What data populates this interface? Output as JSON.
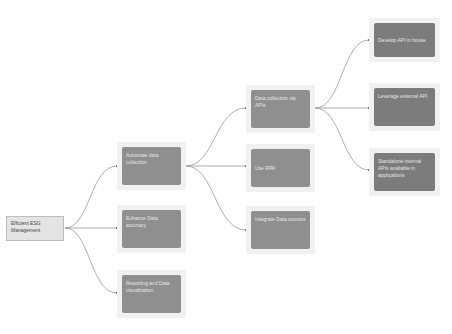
{
  "diagram": {
    "type": "mind-map",
    "colors": {
      "background": "#ffffff",
      "root_fill": "#e4e4e4",
      "root_border": "#bdbdbd",
      "node_frame": "#f1f1f1",
      "node_fill": "#8f8f8f",
      "leaf_fill": "#7c7c7c",
      "node_text": "#e6e6e6",
      "edge": "#9a9a9a"
    },
    "root": {
      "label": "Efficient ESG Management"
    },
    "level1": [
      {
        "label": "Automate data collection"
      },
      {
        "label": "Enhance Data accuracy"
      },
      {
        "label": "Reporting and Data visualization"
      }
    ],
    "level2": [
      {
        "label": "Data collection via APIs"
      },
      {
        "label": "Use RPA"
      },
      {
        "label": "Integrate Data sources"
      }
    ],
    "level3": [
      {
        "label": "Develop API in house"
      },
      {
        "label": "Leverage external API"
      },
      {
        "label": "Standalone internal APIs available in applications"
      }
    ],
    "edges": [
      {
        "from": "Efficient ESG Management",
        "to": "Automate data collection"
      },
      {
        "from": "Efficient ESG Management",
        "to": "Enhance Data accuracy"
      },
      {
        "from": "Efficient ESG Management",
        "to": "Reporting and Data visualization"
      },
      {
        "from": "Automate data collection",
        "to": "Data collection via APIs"
      },
      {
        "from": "Automate data collection",
        "to": "Use RPA"
      },
      {
        "from": "Automate data collection",
        "to": "Integrate Data sources"
      },
      {
        "from": "Data collection via APIs",
        "to": "Develop API in house"
      },
      {
        "from": "Data collection via APIs",
        "to": "Leverage external API"
      },
      {
        "from": "Data collection via APIs",
        "to": "Standalone internal APIs available in applications"
      }
    ]
  }
}
